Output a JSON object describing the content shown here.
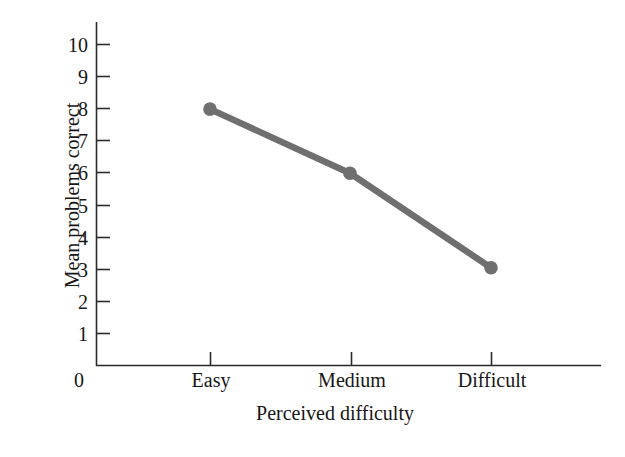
{
  "chart_data": {
    "type": "line",
    "title": "",
    "xlabel": "Perceived difficulty",
    "ylabel": "Mean problems correct",
    "categories": [
      "Easy",
      "Medium",
      "Difficult"
    ],
    "values": [
      8.0,
      6.0,
      3.05
    ],
    "series": [
      {
        "name": "Mean problems correct",
        "values": [
          8.0,
          6.0,
          3.05
        ]
      }
    ],
    "yticks": [
      1,
      2,
      3,
      4,
      5,
      6,
      7,
      8,
      9,
      10
    ],
    "ytick_labels": [
      "1",
      "2",
      "3",
      "4",
      "5",
      "6",
      "7",
      "8",
      "9",
      "10"
    ],
    "origin_label": "0",
    "ylim": [
      0,
      10.8
    ],
    "grid": false,
    "legend": "none",
    "line_color": "#6f6f6f",
    "marker_color": "#6f6f6f",
    "marker": "circle",
    "axis_color": "#2b2b2b"
  }
}
